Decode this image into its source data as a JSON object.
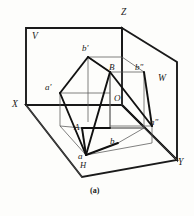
{
  "figure": {
    "caption": "(a)",
    "background_color": "#fdfdfb",
    "line_color": "#1a1a1a",
    "thin_line_color": "#555555"
  },
  "axes": {
    "z_label": "Z",
    "x_label": "X",
    "y_label": "Y",
    "origin_label": "O"
  },
  "planes": {
    "v_label": "V",
    "w_label": "W",
    "h_label": "H"
  },
  "points": {
    "a_front": "a'",
    "b_front": "b'",
    "a_side": "a\"",
    "b_side": "b\"",
    "a_top": "a",
    "b_top": "b",
    "A_space": "A",
    "B_space": "B"
  },
  "geometry": {
    "v_plane": "26,28 122,28 122,105 26,105",
    "w_plane": "122,28 177,62 177,160 122,105",
    "h_plane": "26,105 122,105 177,160 82,177",
    "x_axis": "26,105 122,105",
    "z_axis": "122,28 122,105",
    "y_axis": "122,105 177,160",
    "box_edges": [
      "88,57 110,72",
      "110,72 144,72",
      "144,72 122,57",
      "122,57 88,57",
      "88,57 88,122",
      "110,72 110,128",
      "144,72 144,128",
      "82,128 110,128",
      "110,128 144,128",
      "144,128 152,143",
      "110,128 118,143",
      "86,155 118,143",
      "82,128 86,155"
    ],
    "thick_lines": [
      "60,93 88,57",
      "88,57 110,72",
      "110,72 86,155",
      "86,155 60,93",
      "110,72 152,126",
      "152,126 144,72",
      "82,128 86,155",
      "86,155 118,143"
    ]
  }
}
